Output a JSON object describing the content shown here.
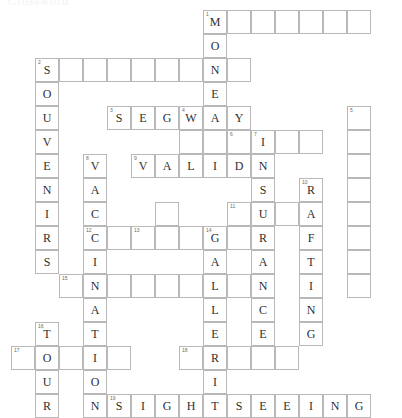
{
  "title": "Crossword",
  "grid": {
    "origin_x": 11,
    "origin_y": 10,
    "cell_size": 24,
    "columns": 16,
    "rows": 16
  },
  "colors": {
    "cell_border": "#b9b9b9",
    "cell_fill": "#ffffff",
    "letter": "#2f2f2f",
    "clue_number": "#6a6a6a",
    "page_background": "#ffffff"
  },
  "entries": [
    {
      "number": "1",
      "direction": "across",
      "row": 0,
      "col": 8,
      "length": 7,
      "answer": "M      "
    },
    {
      "number": "1",
      "direction": "down",
      "row": 0,
      "col": 8,
      "length": 5,
      "answer": "MONEY"
    },
    {
      "number": "2",
      "direction": "across",
      "row": 2,
      "col": 1,
      "length": 9,
      "answer": "S        "
    },
    {
      "number": "2",
      "direction": "down",
      "row": 2,
      "col": 1,
      "length": 9,
      "answer": "SOUVENIRS"
    },
    {
      "number": "3",
      "direction": "across",
      "row": 4,
      "col": 4,
      "length": 6,
      "answer": "SEGWAY"
    },
    {
      "number": "4",
      "direction": "down",
      "row": 4,
      "col": 7,
      "length": 1,
      "answer": "W"
    },
    {
      "number": "5",
      "direction": "down",
      "row": 4,
      "col": 14,
      "length": 9,
      "answer": "         "
    },
    {
      "number": "6",
      "direction": "across",
      "row": 5,
      "col": 9,
      "length": 1,
      "answer": " "
    },
    {
      "number": "7",
      "direction": "down",
      "row": 5,
      "col": 10,
      "length": 7,
      "answer": "INSURAN"
    },
    {
      "number": "7",
      "direction": "across",
      "row": 5,
      "col": 10,
      "length": 3,
      "answer": "I  "
    },
    {
      "number": "8",
      "direction": "down",
      "row": 6,
      "col": 3,
      "length": 11,
      "answer": "VACCINATION"
    },
    {
      "number": "9",
      "direction": "across",
      "row": 6,
      "col": 5,
      "length": 5,
      "answer": "VALID"
    },
    {
      "number": "10",
      "direction": "down",
      "row": 7,
      "col": 12,
      "length": 7,
      "answer": "RAFTING"
    },
    {
      "number": "11",
      "direction": "across",
      "row": 8,
      "col": 9,
      "length": 3,
      "answer": "   "
    },
    {
      "number": "12",
      "direction": "across",
      "row": 9,
      "col": 3,
      "length": 7,
      "answer": "C      "
    },
    {
      "number": "13",
      "direction": "down",
      "row": 9,
      "col": 5,
      "length": 1,
      "answer": " "
    },
    {
      "number": "14",
      "direction": "down",
      "row": 9,
      "col": 8,
      "length": 9,
      "answer": "GALLERIES"
    },
    {
      "number": "15",
      "direction": "across",
      "row": 10,
      "col": 2,
      "length": 9,
      "answer": "         "
    },
    {
      "number": "16",
      "direction": "down",
      "row": 13,
      "col": 1,
      "length": 4,
      "answer": "TOUR"
    },
    {
      "number": "17",
      "direction": "across",
      "row": 14,
      "col": 0,
      "length": 5,
      "answer": "     "
    },
    {
      "number": "18",
      "direction": "across",
      "row": 14,
      "col": 7,
      "length": 5,
      "answer": "     "
    },
    {
      "number": "19",
      "direction": "across",
      "row": 16,
      "col": 4,
      "length": 11,
      "answer": "SIGHTSEEING"
    }
  ],
  "cells": [
    {
      "row": 0,
      "col": 8,
      "letter": "M",
      "number": "1"
    },
    {
      "row": 0,
      "col": 9,
      "letter": "",
      "number": ""
    },
    {
      "row": 0,
      "col": 10,
      "letter": "",
      "number": ""
    },
    {
      "row": 0,
      "col": 11,
      "letter": "",
      "number": ""
    },
    {
      "row": 0,
      "col": 12,
      "letter": "",
      "number": ""
    },
    {
      "row": 0,
      "col": 13,
      "letter": "",
      "number": ""
    },
    {
      "row": 0,
      "col": 14,
      "letter": "",
      "number": ""
    },
    {
      "row": 1,
      "col": 8,
      "letter": "O",
      "number": ""
    },
    {
      "row": 2,
      "col": 1,
      "letter": "S",
      "number": "2"
    },
    {
      "row": 2,
      "col": 2,
      "letter": "",
      "number": ""
    },
    {
      "row": 2,
      "col": 3,
      "letter": "",
      "number": ""
    },
    {
      "row": 2,
      "col": 4,
      "letter": "",
      "number": ""
    },
    {
      "row": 2,
      "col": 5,
      "letter": "",
      "number": ""
    },
    {
      "row": 2,
      "col": 6,
      "letter": "",
      "number": ""
    },
    {
      "row": 2,
      "col": 7,
      "letter": "",
      "number": ""
    },
    {
      "row": 2,
      "col": 8,
      "letter": "N",
      "number": ""
    },
    {
      "row": 2,
      "col": 9,
      "letter": "",
      "number": ""
    },
    {
      "row": 3,
      "col": 1,
      "letter": "O",
      "number": ""
    },
    {
      "row": 3,
      "col": 8,
      "letter": "E",
      "number": ""
    },
    {
      "row": 4,
      "col": 1,
      "letter": "U",
      "number": ""
    },
    {
      "row": 4,
      "col": 4,
      "letter": "S",
      "number": "3"
    },
    {
      "row": 4,
      "col": 5,
      "letter": "E",
      "number": ""
    },
    {
      "row": 4,
      "col": 6,
      "letter": "G",
      "number": ""
    },
    {
      "row": 4,
      "col": 7,
      "letter": "W",
      "number": "4"
    },
    {
      "row": 4,
      "col": 8,
      "letter": "A",
      "number": ""
    },
    {
      "row": 4,
      "col": 9,
      "letter": "Y",
      "number": ""
    },
    {
      "row": 4,
      "col": 14,
      "letter": "",
      "number": "5"
    },
    {
      "row": 5,
      "col": 1,
      "letter": "V",
      "number": ""
    },
    {
      "row": 5,
      "col": 7,
      "letter": "",
      "number": ""
    },
    {
      "row": 5,
      "col": 8,
      "letter": "",
      "number": ""
    },
    {
      "row": 5,
      "col": 9,
      "letter": "",
      "number": "6"
    },
    {
      "row": 5,
      "col": 10,
      "letter": "I",
      "number": "7"
    },
    {
      "row": 5,
      "col": 11,
      "letter": "",
      "number": ""
    },
    {
      "row": 5,
      "col": 12,
      "letter": "",
      "number": ""
    },
    {
      "row": 5,
      "col": 14,
      "letter": "",
      "number": ""
    },
    {
      "row": 6,
      "col": 1,
      "letter": "E",
      "number": ""
    },
    {
      "row": 6,
      "col": 3,
      "letter": "V",
      "number": "8"
    },
    {
      "row": 6,
      "col": 5,
      "letter": "V",
      "number": "9"
    },
    {
      "row": 6,
      "col": 6,
      "letter": "A",
      "number": ""
    },
    {
      "row": 6,
      "col": 7,
      "letter": "L",
      "number": ""
    },
    {
      "row": 6,
      "col": 8,
      "letter": "I",
      "number": ""
    },
    {
      "row": 6,
      "col": 9,
      "letter": "D",
      "number": ""
    },
    {
      "row": 6,
      "col": 10,
      "letter": "N",
      "number": ""
    },
    {
      "row": 6,
      "col": 14,
      "letter": "",
      "number": ""
    },
    {
      "row": 7,
      "col": 1,
      "letter": "N",
      "number": ""
    },
    {
      "row": 7,
      "col": 3,
      "letter": "A",
      "number": ""
    },
    {
      "row": 7,
      "col": 10,
      "letter": "S",
      "number": ""
    },
    {
      "row": 7,
      "col": 12,
      "letter": "R",
      "number": "10"
    },
    {
      "row": 7,
      "col": 14,
      "letter": "",
      "number": ""
    },
    {
      "row": 8,
      "col": 1,
      "letter": "I",
      "number": ""
    },
    {
      "row": 8,
      "col": 3,
      "letter": "C",
      "number": ""
    },
    {
      "row": 8,
      "col": 6,
      "letter": "",
      "number": ""
    },
    {
      "row": 8,
      "col": 9,
      "letter": "",
      "number": "11"
    },
    {
      "row": 8,
      "col": 10,
      "letter": "U",
      "number": ""
    },
    {
      "row": 8,
      "col": 11,
      "letter": "",
      "number": ""
    },
    {
      "row": 8,
      "col": 12,
      "letter": "A",
      "number": ""
    },
    {
      "row": 8,
      "col": 14,
      "letter": "",
      "number": ""
    },
    {
      "row": 9,
      "col": 1,
      "letter": "R",
      "number": ""
    },
    {
      "row": 9,
      "col": 3,
      "letter": "C",
      "number": "12"
    },
    {
      "row": 9,
      "col": 4,
      "letter": "",
      "number": ""
    },
    {
      "row": 9,
      "col": 5,
      "letter": "",
      "number": "13"
    },
    {
      "row": 9,
      "col": 6,
      "letter": "",
      "number": ""
    },
    {
      "row": 9,
      "col": 7,
      "letter": "",
      "number": ""
    },
    {
      "row": 9,
      "col": 8,
      "letter": "G",
      "number": "14"
    },
    {
      "row": 9,
      "col": 9,
      "letter": "",
      "number": ""
    },
    {
      "row": 9,
      "col": 10,
      "letter": "R",
      "number": ""
    },
    {
      "row": 9,
      "col": 12,
      "letter": "F",
      "number": ""
    },
    {
      "row": 9,
      "col": 14,
      "letter": "",
      "number": ""
    },
    {
      "row": 10,
      "col": 1,
      "letter": "S",
      "number": ""
    },
    {
      "row": 10,
      "col": 3,
      "letter": "I",
      "number": ""
    },
    {
      "row": 10,
      "col": 8,
      "letter": "A",
      "number": ""
    },
    {
      "row": 10,
      "col": 10,
      "letter": "A",
      "number": ""
    },
    {
      "row": 10,
      "col": 12,
      "letter": "T",
      "number": ""
    },
    {
      "row": 10,
      "col": 14,
      "letter": "",
      "number": ""
    },
    {
      "row": 11,
      "col": 2,
      "letter": "",
      "number": "15"
    },
    {
      "row": 11,
      "col": 3,
      "letter": "N",
      "number": ""
    },
    {
      "row": 11,
      "col": 4,
      "letter": "",
      "number": ""
    },
    {
      "row": 11,
      "col": 5,
      "letter": "",
      "number": ""
    },
    {
      "row": 11,
      "col": 6,
      "letter": "",
      "number": ""
    },
    {
      "row": 11,
      "col": 7,
      "letter": "",
      "number": ""
    },
    {
      "row": 11,
      "col": 8,
      "letter": "L",
      "number": ""
    },
    {
      "row": 11,
      "col": 9,
      "letter": "",
      "number": ""
    },
    {
      "row": 11,
      "col": 10,
      "letter": "N",
      "number": ""
    },
    {
      "row": 11,
      "col": 12,
      "letter": "I",
      "number": ""
    },
    {
      "row": 11,
      "col": 14,
      "letter": "",
      "number": ""
    },
    {
      "row": 12,
      "col": 3,
      "letter": "A",
      "number": ""
    },
    {
      "row": 12,
      "col": 8,
      "letter": "L",
      "number": ""
    },
    {
      "row": 12,
      "col": 10,
      "letter": "C",
      "number": ""
    },
    {
      "row": 12,
      "col": 12,
      "letter": "N",
      "number": ""
    },
    {
      "row": 13,
      "col": 1,
      "letter": "T",
      "number": "16"
    },
    {
      "row": 13,
      "col": 3,
      "letter": "T",
      "number": ""
    },
    {
      "row": 13,
      "col": 8,
      "letter": "E",
      "number": ""
    },
    {
      "row": 13,
      "col": 10,
      "letter": "E",
      "number": ""
    },
    {
      "row": 13,
      "col": 12,
      "letter": "G",
      "number": ""
    },
    {
      "row": 14,
      "col": 0,
      "letter": "",
      "number": "17"
    },
    {
      "row": 14,
      "col": 1,
      "letter": "O",
      "number": ""
    },
    {
      "row": 14,
      "col": 2,
      "letter": "",
      "number": ""
    },
    {
      "row": 14,
      "col": 3,
      "letter": "I",
      "number": ""
    },
    {
      "row": 14,
      "col": 4,
      "letter": "",
      "number": ""
    },
    {
      "row": 14,
      "col": 7,
      "letter": "",
      "number": "18"
    },
    {
      "row": 14,
      "col": 8,
      "letter": "R",
      "number": ""
    },
    {
      "row": 14,
      "col": 9,
      "letter": "",
      "number": ""
    },
    {
      "row": 14,
      "col": 10,
      "letter": "",
      "number": ""
    },
    {
      "row": 14,
      "col": 11,
      "letter": "",
      "number": ""
    },
    {
      "row": 15,
      "col": 1,
      "letter": "U",
      "number": ""
    },
    {
      "row": 15,
      "col": 3,
      "letter": "O",
      "number": ""
    },
    {
      "row": 15,
      "col": 8,
      "letter": "I",
      "number": ""
    },
    {
      "row": 16,
      "col": 1,
      "letter": "R",
      "number": ""
    },
    {
      "row": 16,
      "col": 3,
      "letter": "N",
      "number": ""
    },
    {
      "row": 16,
      "col": 4,
      "letter": "S",
      "number": "19"
    },
    {
      "row": 16,
      "col": 5,
      "letter": "I",
      "number": ""
    },
    {
      "row": 16,
      "col": 6,
      "letter": "G",
      "number": ""
    },
    {
      "row": 16,
      "col": 7,
      "letter": "H",
      "number": ""
    },
    {
      "row": 16,
      "col": 8,
      "letter": "T",
      "number": ""
    },
    {
      "row": 16,
      "col": 9,
      "letter": "S",
      "number": ""
    },
    {
      "row": 16,
      "col": 10,
      "letter": "E",
      "number": ""
    },
    {
      "row": 16,
      "col": 11,
      "letter": "E",
      "number": ""
    },
    {
      "row": 16,
      "col": 12,
      "letter": "I",
      "number": ""
    },
    {
      "row": 16,
      "col": 13,
      "letter": "N",
      "number": ""
    },
    {
      "row": 16,
      "col": 14,
      "letter": "G",
      "number": ""
    }
  ]
}
